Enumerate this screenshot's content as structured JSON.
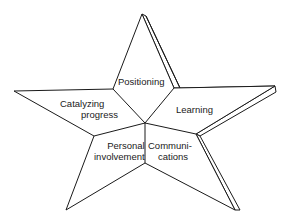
{
  "diagram": {
    "type": "five-point-star",
    "segments": [
      {
        "id": "positioning",
        "label": "Positioning"
      },
      {
        "id": "learning",
        "label": "Learning"
      },
      {
        "id": "communications",
        "label_line1": "Communi-",
        "label_line2": "cations"
      },
      {
        "id": "personal-involvement",
        "label_line1": "Personal",
        "label_line2": "involvement"
      },
      {
        "id": "catalyzing-progress",
        "label_line1": "Catalyzing",
        "label_line2": "progress"
      }
    ],
    "colors": {
      "stroke": "#1a1a1a",
      "fill": "#ffffff"
    }
  }
}
